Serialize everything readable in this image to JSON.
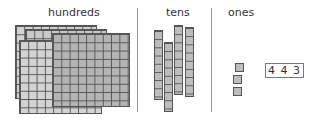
{
  "labels": {
    "hundreds": "hundreds",
    "tens": "tens",
    "ones": "ones"
  },
  "counts": {
    "hundreds": 4,
    "tens": 4,
    "ones": 3
  },
  "value_box": "4 4 3",
  "colors": {
    "block_fill": "#bdbdbd",
    "grid_line": "#555555",
    "divider": "#9a9a9a"
  }
}
